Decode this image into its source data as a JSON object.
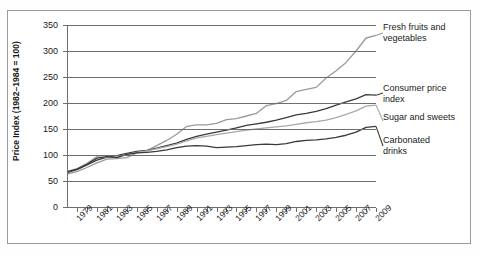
{
  "chart_data": {
    "type": "line",
    "title": "",
    "xlabel": "",
    "ylabel": "Price Index (1982–1984 = 100)",
    "ylim": [
      0,
      350
    ],
    "xlim": [
      1978,
      2009
    ],
    "grid": true,
    "legend_position": "right-inline",
    "yticks": [
      0,
      50,
      100,
      150,
      200,
      250,
      300,
      350
    ],
    "x": [
      1978,
      1979,
      1980,
      1981,
      1982,
      1983,
      1984,
      1985,
      1986,
      1987,
      1988,
      1989,
      1990,
      1991,
      1992,
      1993,
      1994,
      1995,
      1996,
      1997,
      1998,
      1999,
      2000,
      2001,
      2002,
      2003,
      2004,
      2005,
      2006,
      2007,
      2008,
      2009
    ],
    "xtick_labels": [
      "1979",
      "1981",
      "1983",
      "1985",
      "1987",
      "1989",
      "1991",
      "1993",
      "1995",
      "1997",
      "1999",
      "2001",
      "2003",
      "2005",
      "2007",
      "2009"
    ],
    "series": [
      {
        "name": "Fresh fruits and vegetables",
        "color": "#9a9a9a",
        "values": [
          63,
          68,
          76,
          85,
          92,
          93,
          95,
          104,
          108,
          118,
          128,
          140,
          155,
          158,
          158,
          161,
          168,
          170,
          175,
          180,
          195,
          199,
          205,
          222,
          226,
          230,
          248,
          262,
          278,
          300,
          325,
          330
        ]
      },
      {
        "name": "Consumer price index",
        "color": "#3a3a3a",
        "values": [
          66,
          72,
          81,
          90,
          96,
          99,
          103,
          107,
          109,
          113,
          118,
          123,
          130,
          136,
          140,
          144,
          148,
          152,
          157,
          160,
          163,
          167,
          172,
          177,
          180,
          184,
          189,
          196,
          202,
          208,
          216,
          215
        ]
      },
      {
        "name": "Sugar and sweets",
        "color": "#a8a8a8",
        "values": [
          68,
          74,
          84,
          97,
          95,
          96,
          101,
          105,
          108,
          112,
          116,
          121,
          127,
          133,
          136,
          139,
          142,
          145,
          148,
          150,
          152,
          154,
          156,
          159,
          162,
          164,
          167,
          172,
          178,
          185,
          194,
          196
        ]
      },
      {
        "name": "Carbonated drinks",
        "color": "#3a3a3a",
        "values": [
          68,
          73,
          82,
          94,
          97,
          95,
          101,
          104,
          105,
          107,
          110,
          114,
          117,
          118,
          117,
          114,
          115,
          116,
          118,
          120,
          121,
          120,
          122,
          126,
          128,
          129,
          131,
          134,
          138,
          144,
          153,
          155
        ]
      }
    ]
  },
  "legend": {
    "entries": [
      {
        "label_line1": "Fresh fruits and",
        "label_line2": "vegetables"
      },
      {
        "label_line1": "Consumer price",
        "label_line2": "index"
      },
      {
        "label_line1": "Sugar and sweets",
        "label_line2": ""
      },
      {
        "label_line1": "Carbonated",
        "label_line2": "drinks"
      }
    ]
  }
}
